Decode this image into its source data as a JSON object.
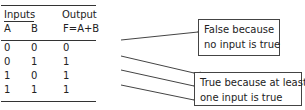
{
  "table": {
    "header": {
      "inputs_label": "Inputs",
      "output_label": "Output",
      "columns": [
        "A",
        "B",
        "F=A+B"
      ]
    },
    "rows": [
      {
        "A": "0",
        "B": "0",
        "F": "0"
      },
      {
        "A": "0",
        "B": "1",
        "F": "1"
      },
      {
        "A": "1",
        "B": "0",
        "F": "1"
      },
      {
        "A": "1",
        "B": "1",
        "F": "1"
      }
    ]
  },
  "callouts": {
    "false_box": {
      "line1": "False because",
      "line2": "no input is true",
      "points_to_rows": [
        0
      ]
    },
    "true_box": {
      "line1": "True because at least",
      "line2": "one input is true",
      "points_to_rows": [
        1,
        2,
        3
      ]
    }
  },
  "colors": {
    "text": "#222222",
    "lines": "#333333",
    "box_border": "#444444",
    "background": "#ffffff"
  }
}
